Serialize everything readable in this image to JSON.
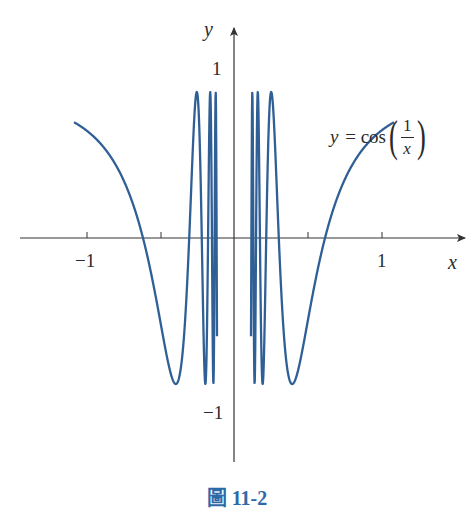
{
  "chart_data": {
    "type": "line",
    "title": "",
    "function": "y = cos(1/x)",
    "series": [
      {
        "name": "y = cos(1/x)",
        "expression": "cos(1/x)",
        "domain": [
          -1.1,
          1.1
        ],
        "color": "#2f5f95"
      }
    ],
    "xlabel": "x",
    "ylabel": "y",
    "xlim": [
      -1.45,
      1.6
    ],
    "ylim": [
      -1.5,
      1.45
    ],
    "x_ticks": [
      -1,
      -0.5,
      0.5,
      1
    ],
    "x_tick_labels": [
      "−1",
      "",
      "",
      "1"
    ],
    "y_tick_labels": [
      "1",
      "−1"
    ],
    "grid": false,
    "legend": "none",
    "annotation": "y = cos(1/x)"
  },
  "labels": {
    "x_axis": "x",
    "y_axis": "y",
    "x_neg_one": "−1",
    "x_pos_one": "1",
    "y_pos_one": "1",
    "y_neg_one": "−1",
    "formula_lhs": "y = cos",
    "formula_num": "1",
    "formula_den": "x",
    "paren_open": "(",
    "paren_close": ")"
  },
  "caption": "圖 11-2",
  "colors": {
    "curve": "#2f5f95",
    "axis": "#333333",
    "caption": "#2e6aa8"
  }
}
